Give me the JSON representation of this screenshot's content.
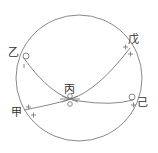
{
  "diagram": {
    "type": "celestial-sphere-great-circles",
    "colors": {
      "stroke": "#7a7a7a",
      "text": "#333333",
      "background": "#ffffff"
    },
    "labels": {
      "yi_top_left": "乙",
      "wu_top_right": "戊",
      "bing_center": "丙",
      "ji_right": "己",
      "jia_bottom_left": "甲"
    }
  }
}
